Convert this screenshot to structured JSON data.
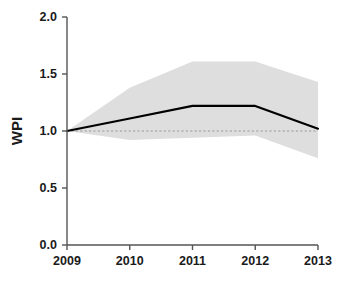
{
  "chart_data": {
    "type": "line",
    "title": "",
    "subtitle": "",
    "xlabel": "",
    "ylabel": "WPI",
    "x": [
      2009,
      2010,
      2011,
      2012,
      2013
    ],
    "xtick_labels": [
      "2009",
      "2010",
      "2011",
      "2012",
      "2013"
    ],
    "ytick_labels": [
      "0.0",
      "0.5",
      "1.0",
      "1.5",
      "2.0"
    ],
    "ytick_values": [
      0.0,
      0.5,
      1.0,
      1.5,
      2.0
    ],
    "xlim": [
      2009,
      2013
    ],
    "ylim": [
      0.0,
      2.0
    ],
    "grid": false,
    "legend": "none",
    "series": [
      {
        "name": "WPI mean",
        "style": "solid-line",
        "color": "#000000",
        "values": [
          1.0,
          1.11,
          1.22,
          1.22,
          1.02
        ]
      },
      {
        "name": "Uncertainty band upper",
        "style": "shaded-area",
        "color": "#dedede",
        "values": [
          1.0,
          1.38,
          1.61,
          1.61,
          1.43
        ]
      },
      {
        "name": "Uncertainty band lower",
        "style": "shaded-area",
        "color": "#dedede",
        "values": [
          1.0,
          0.92,
          0.94,
          0.96,
          0.76
        ]
      },
      {
        "name": "Reference line",
        "style": "dashed-line",
        "color": "#9a9a9a",
        "values": [
          1.0,
          1.0,
          1.0,
          1.0,
          1.0
        ]
      }
    ],
    "annotations": []
  },
  "colors": {
    "axis": "#555555",
    "line": "#000000",
    "band": "#dedede",
    "reference": "#9a9a9a",
    "background": "#ffffff",
    "text": "#1a1a1a"
  }
}
